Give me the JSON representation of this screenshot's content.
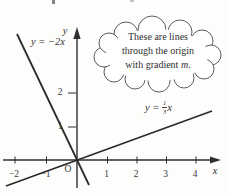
{
  "figure_type": "lines-through-origin-graph",
  "ink_color": "#2f2f2f",
  "callout": {
    "line1": "These are lines",
    "line2": "through the origin",
    "line3_prefix": "with gradient ",
    "line3_var": "m",
    "line3_suffix": "."
  },
  "axes": {
    "x_label": "x",
    "y_label": "y",
    "origin_label": "O",
    "x_tick_labels": [
      "−2",
      "−1",
      "1",
      "2",
      "3",
      "4"
    ],
    "y_tick_labels": [
      "1",
      "2"
    ]
  },
  "lines": {
    "steep_label": "y = −2x",
    "shallow_label_prefix": "y = ",
    "shallow_frac_numerator": "1",
    "shallow_frac_denominator": "3",
    "shallow_label_suffix": "x"
  }
}
